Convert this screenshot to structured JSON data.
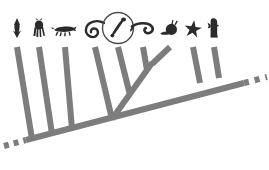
{
  "figure": {
    "type": "cladogram",
    "background_color": "#ffffff",
    "branch_color": "#7d7d7d",
    "silhouette_color": "#2b2b2b",
    "highlight_circle_color": "#4a4a4a",
    "backbone_dashed": true,
    "branch_width_px": 6
  },
  "highlight": {
    "target_taxon_index": 4,
    "shape": "circle",
    "cx": 118,
    "cy": 28,
    "r": 15,
    "stroke_width": 1.4,
    "label": "highlighted-taxon-circle"
  },
  "taxa": [
    {
      "index": 0,
      "name": "arrow-worm",
      "icon": "arrow-worm-silhouette",
      "tip_x": 17,
      "tip_y": 45,
      "icon_x": 17,
      "icon_y": 27
    },
    {
      "index": 1,
      "name": "tardigrade",
      "icon": "tardigrade-silhouette",
      "tip_x": 39,
      "tip_y": 45,
      "icon_x": 39,
      "icon_y": 27
    },
    {
      "index": 2,
      "name": "velvet-worm",
      "icon": "velvet-worm-silhouette",
      "tip_x": 65,
      "tip_y": 45,
      "icon_x": 65,
      "icon_y": 29
    },
    {
      "index": 3,
      "name": "nematode",
      "icon": "nematode-silhouette",
      "tip_x": 95,
      "tip_y": 45,
      "icon_x": 95,
      "icon_y": 29
    },
    {
      "index": 4,
      "name": "annelid-leech",
      "icon": "annelid-leech-silhouette",
      "tip_x": 118,
      "tip_y": 45,
      "icon_x": 118,
      "icon_y": 28
    },
    {
      "index": 5,
      "name": "flatworm",
      "icon": "flatworm-silhouette",
      "tip_x": 143,
      "tip_y": 45,
      "icon_x": 143,
      "icon_y": 30
    },
    {
      "index": 6,
      "name": "snail-mollusk",
      "icon": "snail-silhouette",
      "tip_x": 170,
      "tip_y": 45,
      "icon_x": 170,
      "icon_y": 29
    },
    {
      "index": 7,
      "name": "sea-star",
      "icon": "sea-star-silhouette",
      "tip_x": 193,
      "tip_y": 45,
      "icon_x": 193,
      "icon_y": 29
    },
    {
      "index": 8,
      "name": "bird-vertebrate",
      "icon": "bird-silhouette",
      "tip_x": 214,
      "tip_y": 45,
      "icon_x": 214,
      "icon_y": 27
    }
  ],
  "backbone": {
    "name": "main-backbone-axis",
    "x1": 27,
    "y1": 140,
    "x2": 243,
    "y2": 83,
    "dash_left": {
      "x1": 4,
      "y1": 146,
      "x2": 26,
      "y2": 140
    },
    "dash_right": {
      "x1": 244,
      "y1": 83,
      "x2": 266,
      "y2": 77
    }
  },
  "nodes": [
    {
      "name": "node-root-backbone-left",
      "x": 27,
      "y": 140
    },
    {
      "name": "node-velvet-nematode-clade",
      "x": 112,
      "y": 118
    },
    {
      "name": "node-annelid-flatworm-clade",
      "x": 142,
      "y": 93
    },
    {
      "name": "node-flatworm-split",
      "x": 130,
      "y": 104
    },
    {
      "name": "node-deuterostome-clade",
      "x": 202,
      "y": 78
    }
  ],
  "internal_branches": [
    {
      "name": "branch-to-velvet-nematode-clade",
      "from_x": 112,
      "from_y": 118,
      "to_x": 95,
      "to_y": 45
    },
    {
      "name": "branch-to-annelid-clade",
      "from_x": 130,
      "from_y": 104,
      "to_x": 118,
      "to_y": 45
    },
    {
      "name": "branch-to-flatworm",
      "from_x": 142,
      "from_y": 93,
      "to_x": 143,
      "to_y": 45
    }
  ],
  "accessibility": {
    "alt": "A cladogram of nine animal silhouettes with a gray dashed backbone rising to the right; the fifth taxon, an annelid, is circled."
  }
}
